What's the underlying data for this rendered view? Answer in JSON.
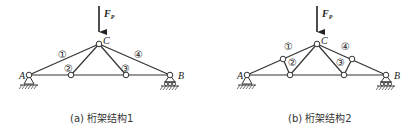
{
  "figures": [
    {
      "id": "a",
      "caption": "(a) 桁架结构1",
      "load": {
        "label": "F",
        "subscript": "P"
      },
      "nodes": {
        "A": "A",
        "B": "B",
        "C": "C"
      },
      "members": [
        "①",
        "②",
        "③",
        "④"
      ]
    },
    {
      "id": "b",
      "caption": "(b) 桁架结构2",
      "load": {
        "label": "F",
        "subscript": "P"
      },
      "nodes": {
        "A": "A",
        "B": "B",
        "C": "C"
      },
      "members": [
        "①",
        "②",
        "③",
        "④"
      ]
    }
  ],
  "colors": {
    "line": "#333333",
    "background": "#ffffff"
  }
}
